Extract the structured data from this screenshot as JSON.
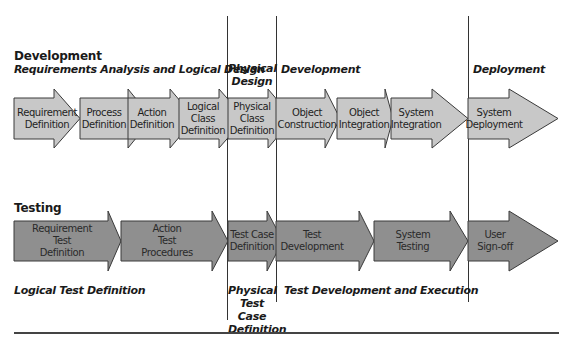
{
  "colors": {
    "dev_arrow_fill": "#c8c8c8",
    "test_arrow_fill": "#8f8f8f",
    "arrow_stroke": "#3a3a3a",
    "divider": "#333333"
  },
  "development": {
    "title": "Development",
    "phases": {
      "logical": "Requirements Analysis and Logical Design",
      "physical_line1": "Physical",
      "physical_line2": "Design",
      "development": "Development",
      "deployment": "Deployment"
    },
    "steps": [
      {
        "line1": "Requirement",
        "line2": "Definition"
      },
      {
        "line1": "Process",
        "line2": "Definition"
      },
      {
        "line1": "Action",
        "line2": "Definition"
      },
      {
        "line1": "Logical",
        "line2": "Class",
        "line3": "Definition"
      },
      {
        "line1": "Physical",
        "line2": "Class",
        "line3": "Definition"
      },
      {
        "line1": "Object",
        "line2": "Construction"
      },
      {
        "line1": "Object",
        "line2": "Integration"
      },
      {
        "line1": "System",
        "line2": "Integration"
      },
      {
        "line1": "System",
        "line2": "Deployment"
      }
    ]
  },
  "testing": {
    "title": "Testing",
    "phases": {
      "logical": "Logical Test Definition",
      "physical_line1": "Physical",
      "physical_line2": "Test Case",
      "physical_line3": "Definition",
      "development": "Test Development and Execution"
    },
    "steps": [
      {
        "line1": "Requirement",
        "line2": "Test",
        "line3": "Definition"
      },
      {
        "line1": "Action",
        "line2": "Test",
        "line3": "Procedures"
      },
      {
        "line1": "Test Case",
        "line2": "Definition"
      },
      {
        "line1": "Test",
        "line2": "Development"
      },
      {
        "line1": "System",
        "line2": "Testing"
      },
      {
        "line1": "User",
        "line2": "Sign-off"
      }
    ]
  }
}
